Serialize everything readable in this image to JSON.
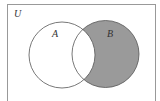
{
  "diagram": {
    "type": "venn",
    "universe_label": "U",
    "sets": [
      {
        "label": "A",
        "shaded": false
      },
      {
        "label": "B",
        "shaded": true
      }
    ],
    "shaded_region": "B only (B minus A)",
    "colors": {
      "shade": "#9a9a9a",
      "stroke": "#555555",
      "border": "#999999",
      "background": "#ffffff"
    }
  }
}
